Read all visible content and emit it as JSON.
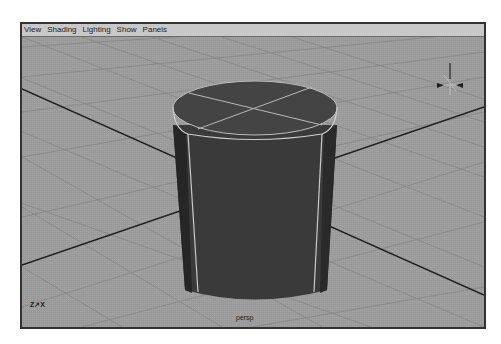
{
  "viewport": {
    "menu": [
      {
        "label": "View"
      },
      {
        "label": "Shading"
      },
      {
        "label": "Lighting"
      },
      {
        "label": "Show"
      },
      {
        "label": "Panels"
      }
    ],
    "camera_label": "persp",
    "axis_indicator": "Z↗X",
    "view_cube_axis_label": "Y"
  },
  "colors": {
    "background": "#9c9c9c",
    "grid": "#8a8a8a",
    "axis_line": "#1e1e1e",
    "cylinder_face": "#3e3e3e",
    "cylinder_dark": "#2a2a2a",
    "edge_highlight": "#cfcfcf"
  }
}
